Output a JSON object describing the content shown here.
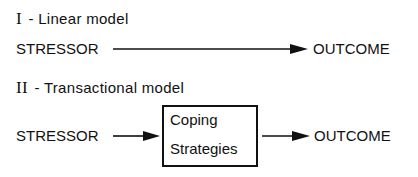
{
  "diagram": {
    "linear": {
      "numeral": "I",
      "title": "- Linear  model",
      "source": "STRESSOR",
      "target": "OUTCOME"
    },
    "transactional": {
      "numeral": "II",
      "title": "- Transactional  model",
      "source": "STRESSOR",
      "mediator_line1": "Coping",
      "mediator_line2": "Strategies",
      "target": "OUTCOME"
    },
    "colors": {
      "ink": "#111111",
      "background": "#ffffff"
    }
  }
}
